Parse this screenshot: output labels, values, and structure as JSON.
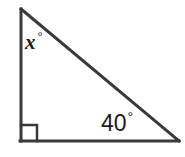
{
  "figure": {
    "kind": "right-triangle-angle-diagram",
    "background_color": "#ffffff",
    "stroke_color": "#3a3a3a",
    "text_color": "#1b1b1b",
    "stroke_width": 3,
    "canvas": {
      "width": 185,
      "height": 157
    },
    "vertices": {
      "apex": {
        "x": 21,
        "y": 9,
        "label": "top-left apex"
      },
      "right_angle": {
        "x": 21,
        "y": 141,
        "label": "bottom-left right angle"
      },
      "base_right": {
        "x": 179,
        "y": 141,
        "label": "bottom-right vertex"
      }
    },
    "right_angle_marker": {
      "name": "right-angle-square",
      "x": 21,
      "y": 125,
      "size": 16,
      "measure": "90"
    },
    "labels": {
      "unknown_angle": {
        "value": "x",
        "degree_symbol": "°",
        "at_vertex": "apex"
      },
      "known_angle": {
        "value": "40",
        "degree_symbol": "°",
        "at_vertex": "base_right"
      }
    }
  }
}
